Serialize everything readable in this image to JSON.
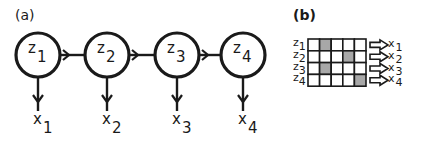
{
  "panel_a": {
    "label": "(a)",
    "nodes": [
      {
        "name": "z",
        "sub": "1",
        "cx": 38
      },
      {
        "name": "z",
        "sub": "2",
        "cx": 107
      },
      {
        "name": "z",
        "sub": "3",
        "cx": 177
      },
      {
        "name": "z",
        "sub": "4",
        "cx": 243
      }
    ],
    "observations": [
      {
        "name": "x",
        "sub": "1"
      },
      {
        "name": "x",
        "sub": "2"
      },
      {
        "name": "x",
        "sub": "3"
      },
      {
        "name": "x",
        "sub": "4"
      }
    ]
  },
  "panel_b": {
    "label": "(b)",
    "rows": [
      {
        "z_name": "z",
        "z_sub": "1",
        "x_name": "x",
        "x_sub": "1",
        "shaded_col": 2
      },
      {
        "z_name": "z",
        "z_sub": "2",
        "x_name": "x",
        "x_sub": "2",
        "shaded_col": 4
      },
      {
        "z_name": "z",
        "z_sub": "3",
        "x_name": "x",
        "x_sub": "3",
        "shaded_col": 2
      },
      {
        "z_name": "z",
        "z_sub": "4",
        "x_name": "x",
        "x_sub": "4",
        "shaded_col": 5
      }
    ],
    "columns": 5,
    "shade_color": "#a8a8a8"
  }
}
